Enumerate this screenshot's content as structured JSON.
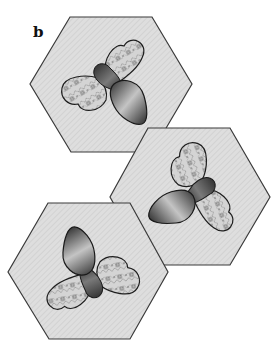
{
  "figure": {
    "panel_label": "b",
    "colors": {
      "hex_fill": "#dcdcdc",
      "hex_stroke": "#3a3a3a",
      "body_dark": "#2a2a2a",
      "body_light": "#bdbdbd",
      "wing_fill": "#cfcfcf",
      "wing_pattern": "#8a8a8a",
      "wing_square": "#6e6e6e"
    },
    "tiles": [
      {
        "id": "tile-top",
        "position": "top-left",
        "rotation_deg": 0
      },
      {
        "id": "tile-right",
        "position": "middle-right",
        "rotation_deg": 90
      },
      {
        "id": "tile-bottom",
        "position": "bottom-left",
        "rotation_deg": 180
      }
    ]
  }
}
